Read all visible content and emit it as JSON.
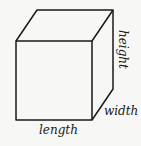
{
  "diagram": {
    "type": "cube-dimensions",
    "shape": "rectangular prism",
    "labels": {
      "length": "length",
      "width": "width",
      "height": "height"
    },
    "colors": {
      "background": "#f7f7f6",
      "stroke": "#1a1a1a"
    }
  }
}
